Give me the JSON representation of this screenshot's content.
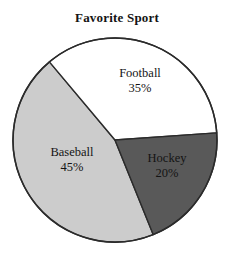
{
  "chart_data": {
    "type": "pie",
    "title": "Favorite Sport",
    "xlabel": "",
    "ylabel": "",
    "legend": "none",
    "grid": false,
    "units": "percent",
    "categories": [
      "Football",
      "Hockey",
      "Baseball"
    ],
    "values": [
      35,
      20,
      45
    ],
    "value_labels": [
      "35%",
      "20%",
      "45%"
    ],
    "colors": [
      "#ffffff",
      "#595959",
      "#cccccc"
    ],
    "outline_color": "#2b2b2b",
    "slices": [
      {
        "name": "Football",
        "value": 35,
        "value_label": "35%",
        "color": "#ffffff",
        "start_angle": -4,
        "end_angle": -130
      },
      {
        "name": "Hockey",
        "value": 20,
        "value_label": "20%",
        "color": "#595959",
        "start_angle": -4,
        "end_angle": 68
      },
      {
        "name": "Baseball",
        "value": 45,
        "value_label": "45%",
        "color": "#cccccc",
        "start_angle": 68,
        "end_angle": 230
      }
    ]
  },
  "chart": {
    "title": "Favorite Sport",
    "labels": {
      "football": {
        "name": "Football",
        "value": "35%"
      },
      "hockey": {
        "name": "Hockey",
        "value": "20%"
      },
      "baseball": {
        "name": "Baseball",
        "value": "45%"
      }
    }
  }
}
